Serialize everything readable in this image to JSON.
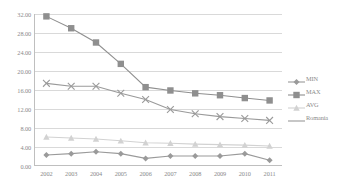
{
  "chart_data": {
    "type": "line",
    "title": "",
    "xlabel": "",
    "ylabel": "",
    "categories": [
      "2002",
      "2003",
      "2004",
      "2005",
      "2006",
      "2007",
      "2008",
      "2009",
      "2010",
      "2011"
    ],
    "ylim": [
      0,
      32
    ],
    "ytick_labels": [
      "0.00",
      "4.00",
      "8.00",
      "12.00",
      "16.00",
      "20.00",
      "24.00",
      "28.00",
      "32.00"
    ],
    "ytick_values": [
      0,
      4,
      8,
      12,
      16,
      20,
      24,
      28,
      32
    ],
    "grid": true,
    "legend_position": "right",
    "series": [
      {
        "name": "MIN",
        "marker": "diamond",
        "color": "#9a9a9a",
        "values": [
          2.3,
          2.6,
          3.0,
          2.6,
          1.6,
          2.1,
          2.1,
          2.1,
          2.6,
          1.2
        ]
      },
      {
        "name": "MAX",
        "marker": "square",
        "color": "#8f8f8f",
        "values": [
          31.5,
          29.0,
          26.0,
          21.5,
          16.6,
          15.9,
          15.3,
          14.9,
          14.3,
          13.8
        ]
      },
      {
        "name": "AVG",
        "marker": "triangle",
        "color": "#d2d2d2",
        "values": [
          6.1,
          5.9,
          5.7,
          5.3,
          4.9,
          4.8,
          4.6,
          4.5,
          4.4,
          4.2
        ]
      },
      {
        "name": "Romania",
        "marker": "x",
        "color": "#9a9a9a",
        "values": [
          17.4,
          16.8,
          16.8,
          15.3,
          14.0,
          11.9,
          11.0,
          10.4,
          10.0,
          9.6
        ]
      }
    ]
  },
  "legend": {
    "items": [
      {
        "label": "MIN"
      },
      {
        "label": "MAX"
      },
      {
        "label": "AVG"
      },
      {
        "label": "Romania"
      }
    ]
  }
}
